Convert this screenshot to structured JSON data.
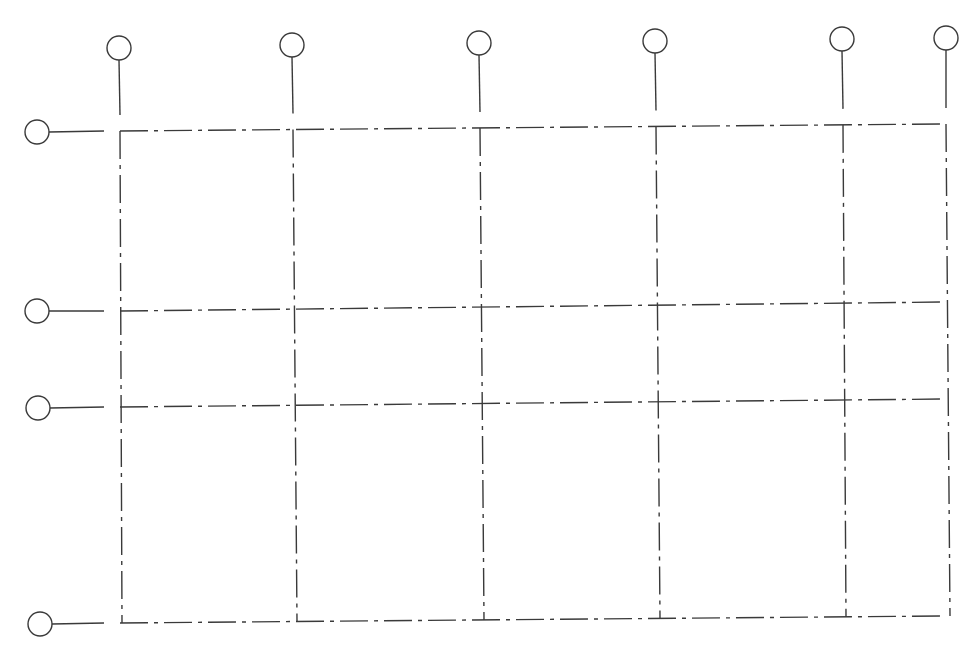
{
  "diagram": {
    "type": "structural-axis-grid",
    "line_color": "#3a3a3a",
    "background": "#ffffff",
    "vertical_axes": [
      {
        "label": "",
        "x_top": 120,
        "x_bottom": 122,
        "bubble": {
          "cx": 119,
          "cy": 48
        }
      },
      {
        "label": "",
        "x_top": 293,
        "x_bottom": 297,
        "bubble": {
          "cx": 292,
          "cy": 45
        }
      },
      {
        "label": "",
        "x_top": 480,
        "x_bottom": 484,
        "bubble": {
          "cx": 479,
          "cy": 43
        }
      },
      {
        "label": "",
        "x_top": 656,
        "x_bottom": 660,
        "bubble": {
          "cx": 655,
          "cy": 41
        }
      },
      {
        "label": "",
        "x_top": 843,
        "x_bottom": 846,
        "bubble": {
          "cx": 842,
          "cy": 39
        }
      },
      {
        "label": "",
        "x_top": 946,
        "x_bottom": 950,
        "bubble": {
          "cx": 946,
          "cy": 38
        }
      }
    ],
    "horizontal_axes": [
      {
        "label": "",
        "y_left": 131,
        "y_right": 124,
        "bubble": {
          "cx": 37,
          "cy": 132
        }
      },
      {
        "label": "",
        "y_left": 311,
        "y_right": 302,
        "bubble": {
          "cx": 37,
          "cy": 311
        }
      },
      {
        "label": "",
        "y_left": 407,
        "y_right": 399,
        "bubble": {
          "cx": 38,
          "cy": 408
        }
      },
      {
        "label": "",
        "y_left": 623,
        "y_right": 616,
        "bubble": {
          "cx": 40,
          "cy": 624
        }
      }
    ],
    "bubble_radius": 12
  }
}
